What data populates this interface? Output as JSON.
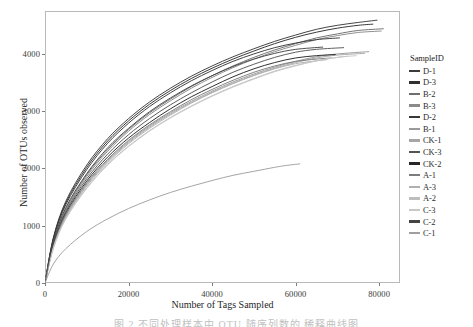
{
  "chart_data": {
    "type": "line",
    "title": "",
    "xlabel": "Number of Tags Sampled",
    "ylabel": "Number of OTUs observed",
    "xlim": [
      0,
      85000
    ],
    "ylim": [
      0,
      4750
    ],
    "xticks": [
      0,
      20000,
      40000,
      60000,
      80000
    ],
    "yticks": [
      0,
      1000,
      2000,
      3000,
      4000
    ],
    "xtick_labels": [
      "0",
      "20000",
      "40000",
      "60000",
      "80000"
    ],
    "ytick_labels": [
      "0",
      "1000",
      "2000",
      "3000",
      "4000"
    ],
    "grid": false,
    "legend_title": "SampleID",
    "legend_position": "right",
    "series": [
      {
        "name": "D-1",
        "color": "#3b3b3b",
        "x_end": 79500,
        "y_end": 4590,
        "points": [
          [
            0,
            0
          ],
          [
            2000,
            790
          ],
          [
            5000,
            1430
          ],
          [
            10000,
            2060
          ],
          [
            15000,
            2520
          ],
          [
            20000,
            2870
          ],
          [
            25000,
            3160
          ],
          [
            30000,
            3400
          ],
          [
            35000,
            3610
          ],
          [
            40000,
            3790
          ],
          [
            45000,
            3950
          ],
          [
            50000,
            4090
          ],
          [
            55000,
            4220
          ],
          [
            60000,
            4330
          ],
          [
            65000,
            4430
          ],
          [
            70000,
            4500
          ],
          [
            75000,
            4550
          ],
          [
            79500,
            4590
          ]
        ]
      },
      {
        "name": "D-3",
        "color": "#2f2f2f",
        "x_end": 78500,
        "y_end": 4520,
        "points": [
          [
            0,
            0
          ],
          [
            2000,
            780
          ],
          [
            5000,
            1400
          ],
          [
            10000,
            2020
          ],
          [
            15000,
            2480
          ],
          [
            20000,
            2830
          ],
          [
            25000,
            3120
          ],
          [
            30000,
            3360
          ],
          [
            35000,
            3570
          ],
          [
            40000,
            3750
          ],
          [
            45000,
            3910
          ],
          [
            50000,
            4050
          ],
          [
            55000,
            4180
          ],
          [
            60000,
            4290
          ],
          [
            65000,
            4380
          ],
          [
            70000,
            4450
          ],
          [
            75000,
            4500
          ],
          [
            78500,
            4520
          ]
        ]
      },
      {
        "name": "B-2",
        "color": "#6e6e6e",
        "x_end": 81000,
        "y_end": 4440,
        "points": [
          [
            0,
            0
          ],
          [
            2000,
            700
          ],
          [
            5000,
            1290
          ],
          [
            10000,
            1890
          ],
          [
            15000,
            2330
          ],
          [
            20000,
            2680
          ],
          [
            25000,
            2970
          ],
          [
            30000,
            3210
          ],
          [
            35000,
            3430
          ],
          [
            40000,
            3620
          ],
          [
            45000,
            3790
          ],
          [
            50000,
            3940
          ],
          [
            55000,
            4070
          ],
          [
            60000,
            4180
          ],
          [
            65000,
            4280
          ],
          [
            70000,
            4350
          ],
          [
            75000,
            4410
          ],
          [
            81000,
            4440
          ]
        ]
      },
      {
        "name": "B-3",
        "color": "#8a8a8a",
        "x_end": 80500,
        "y_end": 4400,
        "points": [
          [
            0,
            0
          ],
          [
            2000,
            690
          ],
          [
            5000,
            1270
          ],
          [
            10000,
            1860
          ],
          [
            15000,
            2300
          ],
          [
            20000,
            2650
          ],
          [
            25000,
            2940
          ],
          [
            30000,
            3180
          ],
          [
            35000,
            3400
          ],
          [
            40000,
            3590
          ],
          [
            45000,
            3760
          ],
          [
            50000,
            3910
          ],
          [
            55000,
            4040
          ],
          [
            60000,
            4150
          ],
          [
            65000,
            4250
          ],
          [
            70000,
            4320
          ],
          [
            75000,
            4375
          ],
          [
            80500,
            4400
          ]
        ]
      },
      {
        "name": "D-2",
        "color": "#383838",
        "x_end": 70500,
        "y_end": 4280,
        "points": [
          [
            0,
            0
          ],
          [
            2000,
            760
          ],
          [
            5000,
            1370
          ],
          [
            10000,
            1980
          ],
          [
            15000,
            2440
          ],
          [
            20000,
            2790
          ],
          [
            25000,
            3080
          ],
          [
            30000,
            3320
          ],
          [
            35000,
            3530
          ],
          [
            40000,
            3710
          ],
          [
            45000,
            3870
          ],
          [
            50000,
            4000
          ],
          [
            55000,
            4110
          ],
          [
            60000,
            4190
          ],
          [
            65000,
            4250
          ],
          [
            70500,
            4280
          ]
        ]
      },
      {
        "name": "B-1",
        "color": "#9a9a9a",
        "x_end": 77500,
        "y_end": 4040,
        "points": [
          [
            0,
            0
          ],
          [
            2000,
            640
          ],
          [
            5000,
            1180
          ],
          [
            10000,
            1730
          ],
          [
            15000,
            2140
          ],
          [
            20000,
            2470
          ],
          [
            25000,
            2740
          ],
          [
            30000,
            2970
          ],
          [
            35000,
            3170
          ],
          [
            40000,
            3350
          ],
          [
            45000,
            3510
          ],
          [
            50000,
            3650
          ],
          [
            55000,
            3770
          ],
          [
            60000,
            3870
          ],
          [
            65000,
            3950
          ],
          [
            70000,
            4000
          ],
          [
            77500,
            4040
          ]
        ]
      },
      {
        "name": "CK-1",
        "color": "#a6a6a6",
        "x_end": 76500,
        "y_end": 4010,
        "points": [
          [
            0,
            0
          ],
          [
            2000,
            630
          ],
          [
            5000,
            1160
          ],
          [
            10000,
            1710
          ],
          [
            15000,
            2120
          ],
          [
            20000,
            2450
          ],
          [
            25000,
            2720
          ],
          [
            30000,
            2950
          ],
          [
            35000,
            3150
          ],
          [
            40000,
            3330
          ],
          [
            45000,
            3490
          ],
          [
            50000,
            3630
          ],
          [
            55000,
            3750
          ],
          [
            60000,
            3850
          ],
          [
            65000,
            3930
          ],
          [
            70000,
            3980
          ],
          [
            76500,
            4010
          ]
        ]
      },
      {
        "name": "CK-3",
        "color": "#555555",
        "x_end": 71500,
        "y_end": 4110,
        "points": [
          [
            0,
            0
          ],
          [
            2000,
            680
          ],
          [
            5000,
            1250
          ],
          [
            10000,
            1820
          ],
          [
            15000,
            2250
          ],
          [
            20000,
            2590
          ],
          [
            25000,
            2870
          ],
          [
            30000,
            3110
          ],
          [
            35000,
            3320
          ],
          [
            40000,
            3510
          ],
          [
            45000,
            3680
          ],
          [
            50000,
            3820
          ],
          [
            55000,
            3940
          ],
          [
            60000,
            4030
          ],
          [
            65000,
            4080
          ],
          [
            71500,
            4110
          ]
        ]
      },
      {
        "name": "CK-2",
        "color": "#262626",
        "x_end": 69500,
        "y_end": 3990,
        "points": [
          [
            0,
            0
          ],
          [
            2000,
            660
          ],
          [
            5000,
            1220
          ],
          [
            10000,
            1780
          ],
          [
            15000,
            2200
          ],
          [
            20000,
            2530
          ],
          [
            25000,
            2800
          ],
          [
            30000,
            3040
          ],
          [
            35000,
            3250
          ],
          [
            40000,
            3430
          ],
          [
            45000,
            3600
          ],
          [
            50000,
            3740
          ],
          [
            55000,
            3850
          ],
          [
            60000,
            3930
          ],
          [
            65000,
            3970
          ],
          [
            69500,
            3990
          ]
        ]
      },
      {
        "name": "A-1",
        "color": "#7c7c7c",
        "x_end": 68500,
        "y_end": 3930,
        "points": [
          [
            0,
            0
          ],
          [
            2000,
            650
          ],
          [
            5000,
            1200
          ],
          [
            10000,
            1750
          ],
          [
            15000,
            2160
          ],
          [
            20000,
            2490
          ],
          [
            25000,
            2760
          ],
          [
            30000,
            2990
          ],
          [
            35000,
            3200
          ],
          [
            40000,
            3380
          ],
          [
            45000,
            3540
          ],
          [
            50000,
            3680
          ],
          [
            55000,
            3790
          ],
          [
            60000,
            3870
          ],
          [
            65000,
            3910
          ],
          [
            68500,
            3930
          ]
        ]
      },
      {
        "name": "A-3",
        "color": "#b0b0b0",
        "x_end": 67500,
        "y_end": 3900,
        "points": [
          [
            0,
            0
          ],
          [
            2000,
            620
          ],
          [
            5000,
            1150
          ],
          [
            10000,
            1690
          ],
          [
            15000,
            2100
          ],
          [
            20000,
            2430
          ],
          [
            25000,
            2700
          ],
          [
            30000,
            2930
          ],
          [
            35000,
            3140
          ],
          [
            40000,
            3320
          ],
          [
            45000,
            3480
          ],
          [
            50000,
            3620
          ],
          [
            55000,
            3740
          ],
          [
            60000,
            3830
          ],
          [
            65000,
            3880
          ],
          [
            67500,
            3900
          ]
        ]
      },
      {
        "name": "A-2",
        "color": "#bdbdbd",
        "x_end": 72500,
        "y_end": 3960,
        "points": [
          [
            0,
            0
          ],
          [
            2000,
            610
          ],
          [
            5000,
            1130
          ],
          [
            10000,
            1660
          ],
          [
            15000,
            2070
          ],
          [
            20000,
            2390
          ],
          [
            25000,
            2660
          ],
          [
            30000,
            2890
          ],
          [
            35000,
            3090
          ],
          [
            40000,
            3270
          ],
          [
            45000,
            3430
          ],
          [
            50000,
            3570
          ],
          [
            55000,
            3700
          ],
          [
            60000,
            3800
          ],
          [
            65000,
            3880
          ],
          [
            70000,
            3940
          ],
          [
            72500,
            3960
          ]
        ]
      },
      {
        "name": "C-3",
        "color": "#c8c8c8",
        "x_end": 74500,
        "y_end": 3970,
        "points": [
          [
            0,
            0
          ],
          [
            2000,
            600
          ],
          [
            5000,
            1120
          ],
          [
            10000,
            1650
          ],
          [
            15000,
            2060
          ],
          [
            20000,
            2380
          ],
          [
            25000,
            2650
          ],
          [
            30000,
            2880
          ],
          [
            35000,
            3080
          ],
          [
            40000,
            3260
          ],
          [
            45000,
            3420
          ],
          [
            50000,
            3560
          ],
          [
            55000,
            3690
          ],
          [
            60000,
            3790
          ],
          [
            65000,
            3880
          ],
          [
            70000,
            3940
          ],
          [
            74500,
            3970
          ]
        ]
      },
      {
        "name": "C-2",
        "color": "#444444",
        "x_end": 66500,
        "y_end": 4120,
        "points": [
          [
            0,
            0
          ],
          [
            2000,
            720
          ],
          [
            5000,
            1320
          ],
          [
            10000,
            1910
          ],
          [
            15000,
            2360
          ],
          [
            20000,
            2700
          ],
          [
            25000,
            2990
          ],
          [
            30000,
            3230
          ],
          [
            35000,
            3440
          ],
          [
            40000,
            3620
          ],
          [
            45000,
            3780
          ],
          [
            50000,
            3910
          ],
          [
            55000,
            4010
          ],
          [
            60000,
            4080
          ],
          [
            66500,
            4120
          ]
        ]
      },
      {
        "name": "C-1",
        "color": "#9f9f9f",
        "x_end": 61000,
        "y_end": 2080,
        "points": [
          [
            0,
            0
          ],
          [
            2000,
            330
          ],
          [
            5000,
            600
          ],
          [
            10000,
            900
          ],
          [
            15000,
            1120
          ],
          [
            20000,
            1300
          ],
          [
            25000,
            1450
          ],
          [
            30000,
            1580
          ],
          [
            35000,
            1690
          ],
          [
            40000,
            1790
          ],
          [
            45000,
            1880
          ],
          [
            50000,
            1950
          ],
          [
            55000,
            2020
          ],
          [
            58000,
            2055
          ],
          [
            61000,
            2080
          ]
        ]
      }
    ]
  },
  "caption": {
    "text": "图 2   不同处理样本中 OTU 随序列数的  稀释曲线图"
  }
}
